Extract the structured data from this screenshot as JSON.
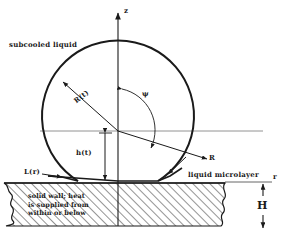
{
  "figure": {
    "title_caption": "",
    "type": "technical-line-diagram"
  },
  "axes": {
    "vertical_label": "z",
    "horizontal_label": "r"
  },
  "labels": {
    "subcooled_liquid": "subcooled liquid",
    "bubble_radius": "R(t)",
    "bubble_height": "h(t)",
    "angle": "ψ",
    "radial_arrow": "R",
    "microlayer_length": "L(r)",
    "liquid_microlayer": "liquid microlayer",
    "wall_thickness": "H"
  },
  "wall_text": {
    "line1": "solid wall; heat",
    "line2": "is supplied from",
    "line3": "within or below"
  },
  "colors": {
    "line": "#1a1a1a",
    "thin_line": "#555555",
    "background": "#ffffff",
    "hatch": "#3a3a3a"
  },
  "geometry": {
    "bubble_center_x": 118,
    "bubble_center_y": 128,
    "bubble_radius_px": 76,
    "wall_top_y": 181,
    "wall_bottom_y": 226,
    "r_axis_y": 131,
    "z_axis_x": 118
  }
}
